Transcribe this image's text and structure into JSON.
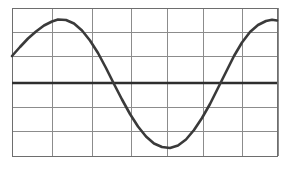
{
  "figure": {
    "title": "",
    "background_color": "#ffffff"
  },
  "chart_data": {
    "type": "line",
    "title": "",
    "subtitle": "",
    "xlabel": "",
    "ylabel": "",
    "grid": true,
    "legend": false,
    "legend_position": "none",
    "x": [
      0,
      0.25,
      0.5,
      0.75,
      1,
      1.25,
      1.5,
      1.75,
      2,
      2.25,
      2.5,
      2.75,
      3,
      3.25,
      3.5,
      3.75,
      4,
      4.25,
      4.5,
      4.75,
      5,
      5.25,
      5.5,
      5.75,
      6,
      6.25,
      6.5,
      6.75,
      7
    ],
    "series": [
      {
        "name": "sine wave",
        "color": "#3a3a3a",
        "line_width": 2.6,
        "values": [
          0.5,
          0.74,
          0.91,
          0.99,
          0.98,
          0.87,
          0.68,
          0.43,
          0.14,
          -0.17,
          -0.46,
          -0.7,
          -0.88,
          -0.98,
          -1.0,
          -0.93,
          -0.78,
          -0.56,
          -0.29,
          0.01,
          0.31,
          0.58,
          0.79,
          0.94,
          1.0,
          0.97,
          0.85,
          0.66,
          0.41
        ]
      },
      {
        "name": "zero axis",
        "color": "#2e2e2e",
        "line_width": 2.4,
        "values": [
          0,
          0,
          0,
          0,
          0,
          0,
          0,
          0,
          0,
          0,
          0,
          0,
          0,
          0,
          0,
          0,
          0,
          0,
          0,
          0,
          0,
          0,
          0,
          0,
          0,
          0,
          0,
          0,
          0
        ]
      }
    ],
    "xlim": [
      0,
      7
    ],
    "ylim": [
      -1.55,
      1.55
    ],
    "xticks": [
      0,
      1,
      2,
      3,
      4,
      5,
      6,
      7
    ],
    "xticklabels": [
      "",
      "",
      "",
      "",
      "",
      "",
      "",
      ""
    ],
    "yticks": [
      -1.5,
      -1.0,
      -0.5,
      0,
      0.5,
      1.0,
      1.5
    ],
    "yticklabels": [
      "",
      "",
      "",
      "",
      "",
      "",
      ""
    ],
    "annotations": [],
    "grid_columns": 7,
    "grid_rows": 6,
    "amplitude": 1.0,
    "period": 5.4,
    "phase_start_value": 0.5
  },
  "colors": {
    "grid": "#8c8c8c",
    "border": "#6e6e6e",
    "curve": "#3a3a3a",
    "axis": "#2e2e2e",
    "background": "#ffffff"
  },
  "geometry": {
    "plot_left": 12,
    "plot_right": 278,
    "plot_top": 8,
    "plot_bottom": 156,
    "axis_y": 83,
    "vertical_gridlines": [
      12,
      52,
      92,
      131,
      167,
      203,
      242,
      278
    ],
    "horizontal_gridlines": [
      8,
      32,
      56,
      83,
      107,
      131,
      156
    ],
    "curve_points": "12,56 20,47 28,38 36,31 44,25 52,21 58,19 66,20 74,24 82,31 90,41 98,53 106,68 114,84 122,99 130,114 138,127 146,137 154,144 162,147 170,148 178,145 186,139 194,130 202,118 210,104 218,88 226,72 234,56 242,42 250,32 258,25 266,21 272,20 278,21"
  }
}
